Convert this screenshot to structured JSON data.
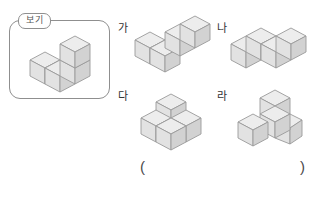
{
  "page": {
    "background_color": "#ffffff",
    "type": "math-worksheet-question"
  },
  "example": {
    "tab_label": "보기",
    "box": {
      "border_color": "#8f8f8f",
      "fill": "#ffffff"
    },
    "shape_name": "example-cube-shape",
    "cube_count": 4,
    "description": "row of three cubes with one cube stacked on the back-left"
  },
  "options": [
    {
      "key": "ga",
      "label": "가",
      "cube_count": 4,
      "shape_name": "option-shape-ga",
      "description": "L-shaped flat arrangement of four cubes"
    },
    {
      "key": "na",
      "label": "나",
      "cube_count": 4,
      "shape_name": "option-shape-na",
      "description": "zigzag S-shaped flat arrangement of four cubes"
    },
    {
      "key": "da",
      "label": "다",
      "cube_count": 4,
      "shape_name": "option-shape-da",
      "description": "three cubes in an L with one cube stacked on the corner"
    },
    {
      "key": "ra",
      "label": "라",
      "cube_count": 4,
      "shape_name": "option-shape-ra",
      "description": "three cubes in a T with one cube stacked on the corner"
    }
  ],
  "answer": {
    "paren_open": "(",
    "paren_close": ")",
    "value": ""
  },
  "colors": {
    "cube_top": "#ededed",
    "cube_left": "#e2e2e2",
    "cube_right": "#d2d2d2",
    "cube_stroke": "#9a9a9a",
    "box_border": "#8f8f8f",
    "text": "#333333"
  }
}
